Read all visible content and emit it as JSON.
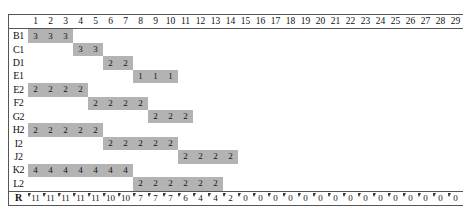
{
  "chart_data": {
    "type": "table",
    "title": "",
    "xlabel": "",
    "ylabel": "",
    "grid": false,
    "legend": null,
    "columns": [
      1,
      2,
      3,
      4,
      5,
      6,
      7,
      8,
      9,
      10,
      11,
      12,
      13,
      14,
      15,
      16,
      17,
      18,
      19,
      20,
      21,
      22,
      23,
      24,
      25,
      26,
      27,
      28,
      29
    ],
    "column_count": 29,
    "rows": [
      {
        "label": "B1",
        "start": 1,
        "end": 3,
        "value": "3",
        "values": [
          "3",
          "3",
          "3"
        ]
      },
      {
        "label": "C1",
        "start": 4,
        "end": 5,
        "value": "3",
        "values": [
          "3",
          "3"
        ]
      },
      {
        "label": "D1",
        "start": 6,
        "end": 7,
        "value": "2",
        "values": [
          "2",
          "2"
        ]
      },
      {
        "label": "E1",
        "start": 8,
        "end": 10,
        "value": "1",
        "values": [
          "1",
          "1",
          "1"
        ]
      },
      {
        "label": "E2",
        "start": 1,
        "end": 4,
        "value": "2",
        "values": [
          "2",
          "2",
          "2",
          "2"
        ]
      },
      {
        "label": "F2",
        "start": 5,
        "end": 8,
        "value": "2",
        "values": [
          "2",
          "2",
          "2",
          "2"
        ]
      },
      {
        "label": "G2",
        "start": 9,
        "end": 11,
        "value": "2",
        "values": [
          "2",
          "2",
          "2"
        ]
      },
      {
        "label": "H2",
        "start": 1,
        "end": 5,
        "value": "2",
        "values": [
          "2",
          "2",
          "2",
          "2",
          "2"
        ]
      },
      {
        "label": "I2",
        "start": 6,
        "end": 10,
        "value": "2",
        "values": [
          "2",
          "2",
          "2",
          "2",
          "2"
        ]
      },
      {
        "label": "J2",
        "start": 11,
        "end": 14,
        "value": "2",
        "values": [
          "2",
          "2",
          "2",
          "2"
        ]
      },
      {
        "label": "K2",
        "start": 1,
        "end": 7,
        "value": "4",
        "values": [
          "4",
          "4",
          "4",
          "4",
          "4",
          "4",
          "4"
        ]
      },
      {
        "label": "L2",
        "start": 8,
        "end": 13,
        "value": "2",
        "values": [
          "2",
          "2",
          "2",
          "2",
          "2",
          "2"
        ]
      }
    ],
    "resource_row": {
      "label": "R",
      "values": [
        "11",
        "11",
        "11",
        "11",
        "11",
        "10",
        "10",
        "7",
        "7",
        "7",
        "6",
        "4",
        "4",
        "2",
        "0",
        "0",
        "0",
        "0",
        "0",
        "0",
        "0",
        "0",
        "0",
        "0",
        "0",
        "0",
        "0",
        "0",
        "0"
      ]
    },
    "colors": {
      "bar_fill": "#b3b3b3",
      "background": "#ffffff",
      "border": "#565656",
      "text": "#101010"
    }
  }
}
